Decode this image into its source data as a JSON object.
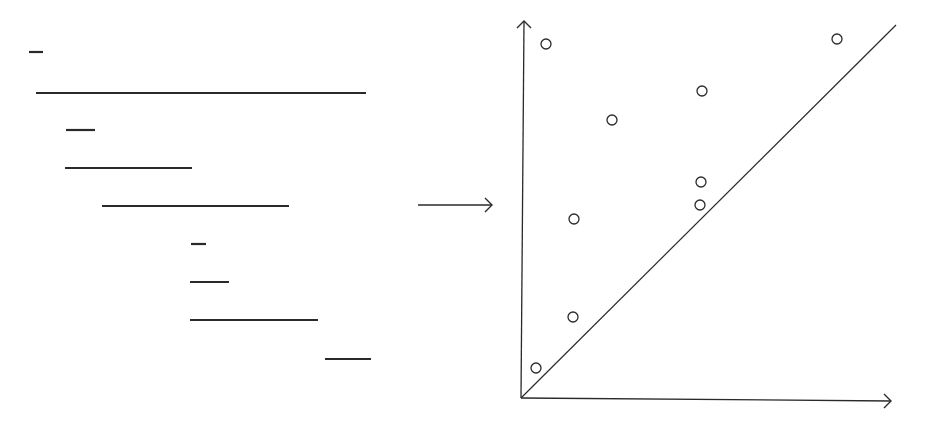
{
  "figure": {
    "type": "barcode-to-persistence-diagram",
    "ink_color": "#2a2a2a",
    "background": "#ffffff"
  },
  "barcode": {
    "bars": [
      {
        "x1": 29,
        "x2": 43,
        "y": 52
      },
      {
        "x1": 36,
        "x2": 366,
        "y": 93
      },
      {
        "x1": 66,
        "x2": 95,
        "y": 130
      },
      {
        "x1": 65,
        "x2": 192,
        "y": 168
      },
      {
        "x1": 102,
        "x2": 289,
        "y": 206
      },
      {
        "x1": 191,
        "x2": 206,
        "y": 244
      },
      {
        "x1": 190,
        "x2": 229,
        "y": 282
      },
      {
        "x1": 190,
        "x2": 318,
        "y": 320
      },
      {
        "x1": 325,
        "x2": 371,
        "y": 359
      }
    ]
  },
  "transform_arrow": {
    "x1": 418,
    "x2": 492,
    "y": 205
  },
  "diagram": {
    "origin": {
      "x": 521,
      "y": 398
    },
    "y_axis_top": {
      "x": 524,
      "y": 21
    },
    "x_axis_end": {
      "x": 891,
      "y": 401
    },
    "diagonal_end": {
      "x": 896,
      "y": 25
    },
    "point_radius": 5,
    "points": [
      {
        "x": 546,
        "y": 44
      },
      {
        "x": 837,
        "y": 39
      },
      {
        "x": 702,
        "y": 91
      },
      {
        "x": 612,
        "y": 120
      },
      {
        "x": 701,
        "y": 182
      },
      {
        "x": 700,
        "y": 205
      },
      {
        "x": 574,
        "y": 219
      },
      {
        "x": 573,
        "y": 317
      },
      {
        "x": 536,
        "y": 368
      }
    ]
  }
}
